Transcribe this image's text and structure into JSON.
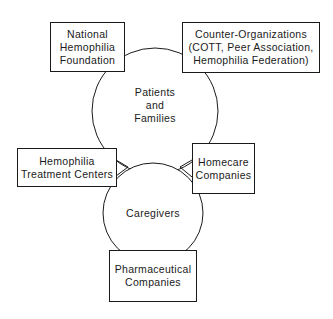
{
  "diagram": {
    "type": "relationship-diagram",
    "circles": {
      "patients_families": {
        "lines": [
          "Patients",
          "and",
          "Families"
        ]
      },
      "caregivers": {
        "lines": [
          "Caregivers"
        ]
      }
    },
    "boxes": {
      "national_hemophilia_foundation": {
        "lines": [
          "National",
          "Hemophilia",
          "Foundation"
        ]
      },
      "counter_organizations": {
        "lines": [
          "Counter-Organizations",
          "(COTT, Peer Association,",
          "Hemophilia Federation)"
        ]
      },
      "hemophilia_treatment_centers": {
        "lines": [
          "Hemophilia",
          "Treatment Centers"
        ]
      },
      "homecare_companies": {
        "lines": [
          "Homecare",
          "Companies"
        ]
      },
      "pharmaceutical_companies": {
        "lines": [
          "Pharmaceutical",
          "Companies"
        ]
      }
    },
    "connections": [
      {
        "from": "hemophilia_treatment_centers",
        "to": "caregivers",
        "style": "fork"
      },
      {
        "from": "homecare_companies",
        "to": "caregivers",
        "style": "fork"
      }
    ],
    "colors": {
      "stroke": "#1a1a1a",
      "background": "#ffffff"
    }
  }
}
